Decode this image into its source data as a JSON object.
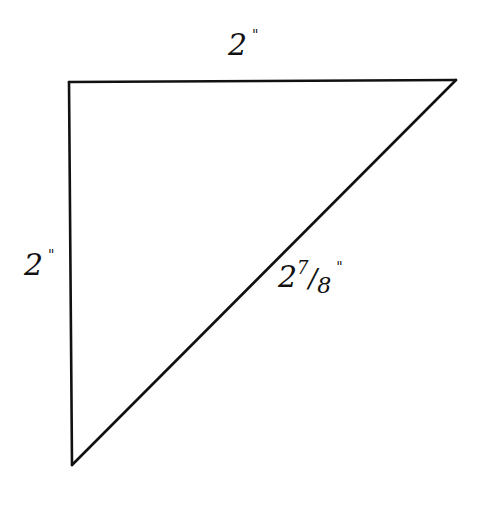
{
  "diagram": {
    "type": "right-triangle",
    "stroke_color": "#111111",
    "background": "#ffffff",
    "vertices": {
      "top_left": [
        69,
        82
      ],
      "top_right": [
        456,
        80
      ],
      "bottom_left": [
        72,
        465
      ]
    },
    "labels": {
      "top_side": {
        "whole": "2",
        "unit": "\""
      },
      "left_side": {
        "whole": "2",
        "unit": "\""
      },
      "hypotenuse": {
        "whole": "2",
        "numerator": "7",
        "slash": "/",
        "denominator": "8",
        "unit": "\""
      }
    }
  }
}
